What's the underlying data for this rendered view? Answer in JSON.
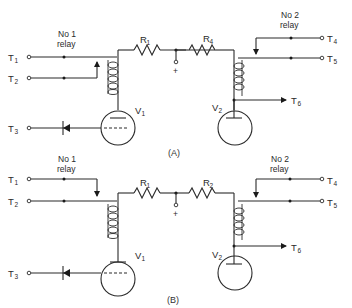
{
  "figure": {
    "diagrams": [
      {
        "caption": "(A)",
        "relay1_label_line1": "No 1",
        "relay1_label_line2": "relay",
        "relay2_label_line1": "No 2",
        "relay2_label_line2": "relay",
        "terminals": {
          "t1": {
            "main": "T",
            "sub": "1"
          },
          "t2": {
            "main": "T",
            "sub": "2"
          },
          "t3": {
            "main": "T",
            "sub": "3"
          },
          "t4": {
            "main": "T",
            "sub": "4"
          },
          "t5": {
            "main": "T",
            "sub": "5"
          },
          "t6": {
            "main": "T",
            "sub": "6"
          }
        },
        "resistor_left": {
          "main": "R",
          "sub": "1"
        },
        "resistor_right": {
          "main": "R",
          "sub": "4"
        },
        "tube_left": {
          "main": "V",
          "sub": "1"
        },
        "tube_right": {
          "main": "V",
          "sub": "2"
        },
        "supply_label": "+",
        "relay1_arrow": "up",
        "relay2_arrow": "down"
      },
      {
        "caption": "(B)",
        "relay1_label_line1": "No 1",
        "relay1_label_line2": "relay",
        "relay2_label_line1": "No 2",
        "relay2_label_line2": "relay",
        "terminals": {
          "t1": {
            "main": "T",
            "sub": "1"
          },
          "t2": {
            "main": "T",
            "sub": "2"
          },
          "t3": {
            "main": "T",
            "sub": "3"
          },
          "t4": {
            "main": "T",
            "sub": "4"
          },
          "t5": {
            "main": "T",
            "sub": "5"
          },
          "t6": {
            "main": "T",
            "sub": "6"
          }
        },
        "resistor_left": {
          "main": "R",
          "sub": "1"
        },
        "resistor_right": {
          "main": "R",
          "sub": "2"
        },
        "tube_left": {
          "main": "V",
          "sub": "1"
        },
        "tube_right": {
          "main": "V",
          "sub": "2"
        },
        "supply_label": "+",
        "relay1_arrow": "down",
        "relay2_arrow": "down"
      }
    ]
  }
}
